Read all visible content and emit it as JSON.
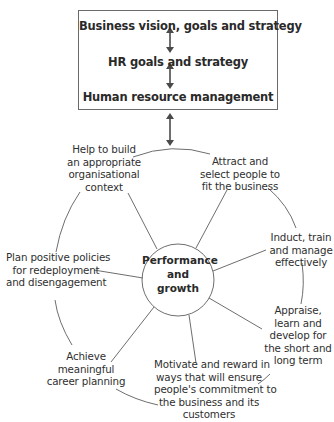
{
  "box": {
    "lines": [
      "Business vision, goals and strategy",
      "HR goals and strategy",
      "Human resource management"
    ]
  },
  "center": {
    "lines": [
      "Performance",
      "and",
      "growth"
    ]
  },
  "activities": [
    {
      "id": "organisational-context",
      "lines": [
        "Help to build",
        "an appropriate",
        "organisational",
        "context"
      ]
    },
    {
      "id": "attract-select",
      "lines": [
        "Attract and",
        "select people to",
        "fit the business"
      ]
    },
    {
      "id": "induct-train",
      "lines": [
        "Induct, train",
        "and manage",
        "effectively"
      ]
    },
    {
      "id": "appraise-develop",
      "lines": [
        "Appraise,",
        "learn and",
        "develop for",
        "the short and",
        "long term"
      ]
    },
    {
      "id": "motivate-reward",
      "lines": [
        "Motivate and reward in",
        "ways that will ensure",
        "people's commitment to",
        "the business and its",
        "customers"
      ]
    },
    {
      "id": "career-planning",
      "lines": [
        "Achieve",
        "meaningful",
        "career planning"
      ]
    },
    {
      "id": "redeployment",
      "lines": [
        "Plan positive policies",
        "for redeployment",
        "and disengagement"
      ]
    }
  ],
  "colors": {
    "line": "#6e6e6e",
    "arrow": "#4a4a4a",
    "text": "#2a2a2a"
  }
}
